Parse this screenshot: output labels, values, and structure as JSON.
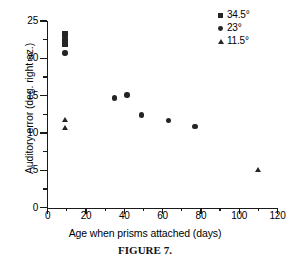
{
  "chart_data": {
    "type": "scatter",
    "title": "",
    "xlabel": "Age when prisms attached (days)",
    "ylabel": "Auditory error (deg. right az.)",
    "xlim": [
      0,
      120
    ],
    "ylim": [
      0,
      25
    ],
    "xticks": [
      0,
      20,
      40,
      60,
      80,
      100,
      120
    ],
    "yticks": [
      0,
      5,
      10,
      15,
      20,
      25
    ],
    "xtick_labels": [
      "0",
      "20",
      "40",
      "60",
      "80",
      "100",
      "120"
    ],
    "ytick_labels": [
      "0",
      "5",
      "10",
      "15",
      "20",
      "25"
    ],
    "minor_ticks": true,
    "grid": false,
    "legend_position": "top-right",
    "series": [
      {
        "name": "34.5°",
        "marker": "square",
        "color": "#252525",
        "points": [
          {
            "x": 9.0,
            "y": 23.3
          },
          {
            "x": 9.0,
            "y": 22.4
          },
          {
            "x": 9.0,
            "y": 21.8
          }
        ]
      },
      {
        "name": "23°",
        "marker": "circle",
        "color": "#252525",
        "points": [
          {
            "x": 9.0,
            "y": 22.9
          },
          {
            "x": 9.0,
            "y": 20.7
          },
          {
            "x": 35.0,
            "y": 14.7
          },
          {
            "x": 41.5,
            "y": 15.1
          },
          {
            "x": 49.0,
            "y": 12.4
          },
          {
            "x": 63.0,
            "y": 11.7
          },
          {
            "x": 77.0,
            "y": 10.9
          }
        ]
      },
      {
        "name": "11.5°",
        "marker": "triangle",
        "color": "#252525",
        "points": [
          {
            "x": 9.0,
            "y": 11.7
          },
          {
            "x": 9.0,
            "y": 10.7
          },
          {
            "x": 110.0,
            "y": 5.0
          }
        ]
      }
    ]
  },
  "legend": {
    "entries": [
      {
        "label": "34.5°",
        "marker": "square"
      },
      {
        "label": "23°",
        "marker": "circle"
      },
      {
        "label": "11.5°",
        "marker": "triangle"
      }
    ]
  },
  "caption": "FIGURE 7."
}
